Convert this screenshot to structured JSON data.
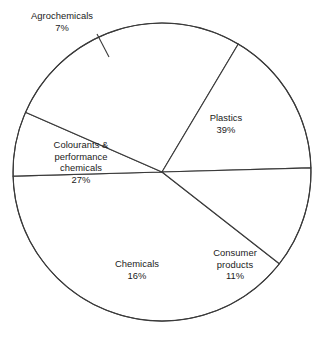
{
  "chart_data": {
    "type": "pie",
    "title": "",
    "subtitle": "",
    "xlabel": "",
    "ylabel": "",
    "legend_position": "none",
    "grid": false,
    "unit": "%",
    "total": 100,
    "categories": [
      "Plastics",
      "Agrochemicals",
      "Colourants & performance chemicals",
      "Chemicals",
      "Consumer products"
    ],
    "values": [
      39,
      7,
      27,
      16,
      11
    ],
    "slices": [
      {
        "name": "Plastics",
        "value": 39,
        "value_label": "39%",
        "label_lines": [
          "Plastics",
          "39%"
        ],
        "start_angle_deg": 38,
        "end_angle_deg": 178.4,
        "fill": "#ffffff",
        "stroke": "#3a3a3a"
      },
      {
        "name": "Agrochemicals",
        "value": 7,
        "value_label": "7%",
        "label_lines": [
          "Agrochemicals",
          "7%"
        ],
        "start_angle_deg": 178.4,
        "end_angle_deg": 203.6,
        "fill": "#ffffff",
        "stroke": "#3a3a3a",
        "has_leader_line": true
      },
      {
        "name": "Colourants & performance chemicals",
        "value": 27,
        "value_label": "27%",
        "label_lines": [
          "Colourants &",
          "performance",
          "chemicals",
          "27%"
        ],
        "start_angle_deg": 203.6,
        "end_angle_deg": 300.8,
        "fill": "#ffffff",
        "stroke": "#3a3a3a"
      },
      {
        "name": "Chemicals",
        "value": 16,
        "value_label": "16%",
        "label_lines": [
          "Chemicals",
          "16%"
        ],
        "start_angle_deg": 300.8,
        "end_angle_deg": 358.4,
        "fill": "#ffffff",
        "stroke": "#3a3a3a"
      },
      {
        "name": "Consumer products",
        "value": 11,
        "value_label": "11%",
        "label_lines": [
          "Consumer",
          "products",
          "11%"
        ],
        "start_angle_deg": 358.4,
        "end_angle_deg": 398,
        "fill": "#ffffff",
        "stroke": "#3a3a3a"
      }
    ]
  },
  "labels": {
    "agrochemicals": "Agrochemicals\n7%",
    "plastics": "Plastics\n39%",
    "colourants": "Colourants &\nperformance\nchemicals\n27%",
    "chemicals": "Chemicals\n16%",
    "consumer": "Consumer\nproducts\n11%"
  },
  "colors": {
    "background": "#ffffff",
    "stroke": "#3a3a3a",
    "text": "#1a1a1a"
  }
}
